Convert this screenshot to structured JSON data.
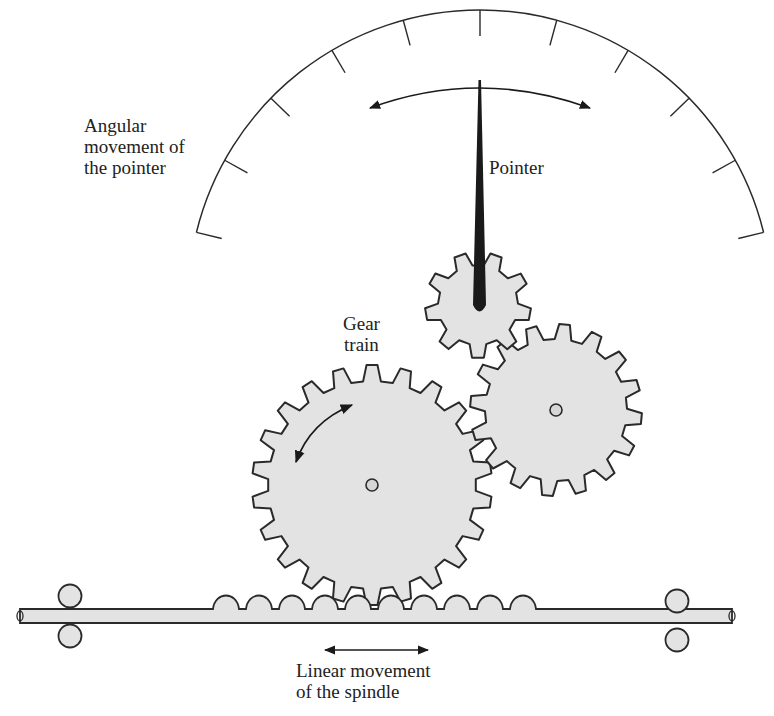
{
  "diagram": {
    "labels": {
      "angular": "Angular\nmovement of\nthe pointer",
      "pointer": "Pointer",
      "gear_train": "Gear\ntrain",
      "linear": "Linear movement\nof the spindle"
    },
    "components": [
      {
        "name": "Scale arc",
        "ticks": 11
      },
      {
        "name": "Pointer"
      },
      {
        "name": "Pinion gear (pointer)",
        "teeth": 9
      },
      {
        "name": "Intermediate gear",
        "teeth": 16
      },
      {
        "name": "Large gear",
        "teeth": 22
      },
      {
        "name": "Spindle rack",
        "teeth": 10
      },
      {
        "name": "Guide rollers",
        "count": 4
      }
    ],
    "colors": {
      "line": "#2a2a2a",
      "fill": "#e3e3e3",
      "pointer": "#1a1a1a",
      "background": "#ffffff"
    }
  }
}
